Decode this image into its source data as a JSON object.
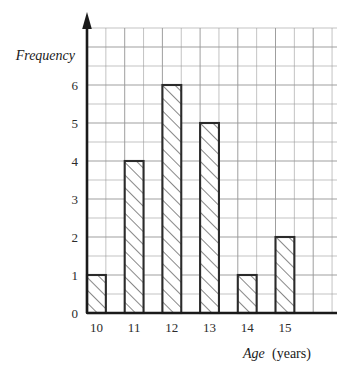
{
  "chart_data": {
    "type": "bar",
    "title": "",
    "subtitle": "",
    "xlabel_italic": "Age",
    "xlabel_plain": "(years)",
    "ylabel": "Frequency",
    "categories": [
      "10",
      "11",
      "12",
      "13",
      "14",
      "15"
    ],
    "values": [
      1,
      4,
      6,
      5,
      1,
      2
    ],
    "series": [
      {
        "name": "Frequency",
        "values": [
          1,
          4,
          6,
          5,
          1,
          2
        ]
      }
    ],
    "y_ticks": [
      "0",
      "1",
      "2",
      "3",
      "4",
      "5",
      "6"
    ],
    "y_tick_values": [
      0,
      1,
      2,
      3,
      4,
      5,
      6
    ],
    "x_tick_labels": [
      "10",
      "11",
      "12",
      "13",
      "14",
      "15"
    ],
    "ylim": [
      0,
      6
    ],
    "grid": "on",
    "legend": "none",
    "bar_fill": "hatched-diagonal",
    "bar_edge_color": "#2b2b2b",
    "grid_color": "#9a9a9a",
    "axis_color": "#1a1a1a",
    "annotations": []
  },
  "axes": {
    "y_arrow": "up-arrow-icon",
    "x_axis_name": "horizontal-axis",
    "y_axis_name": "vertical-axis"
  }
}
